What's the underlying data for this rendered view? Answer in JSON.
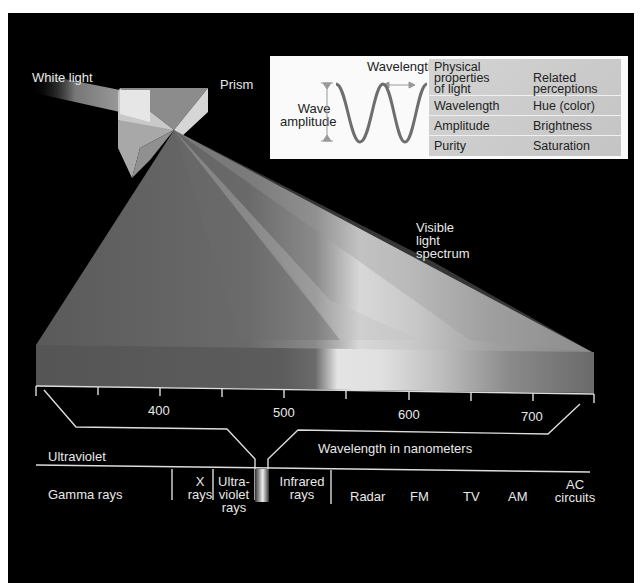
{
  "diagram": {
    "labels": {
      "white_light": "White light",
      "prism": "Prism",
      "visible_spectrum": [
        "Visible",
        "light",
        "spectrum"
      ],
      "ultraviolet": "Ultraviolet",
      "wavelength_axis": "Wavelength in nanometers"
    },
    "wave_inset": {
      "wavelength_label": "Wavelength",
      "amplitude_label": [
        "Wave",
        "amplitude"
      ]
    },
    "properties_table": {
      "headers": [
        [
          "Physical",
          "properties",
          "of light"
        ],
        [
          "Related",
          "perceptions"
        ]
      ],
      "rows": [
        {
          "property": "Wavelength",
          "perception": "Hue (color)"
        },
        {
          "property": "Amplitude",
          "perception": "Brightness"
        },
        {
          "property": "Purity",
          "perception": "Saturation"
        }
      ]
    },
    "nm_scale": {
      "ticks": [
        350,
        400,
        450,
        500,
        550,
        600,
        650,
        700,
        750
      ],
      "tick_labels": [
        "400",
        "500",
        "600",
        "700"
      ]
    },
    "em_spectrum": {
      "bands": [
        {
          "label": [
            "Gamma rays"
          ]
        },
        {
          "label": [
            "X",
            "rays"
          ]
        },
        {
          "label": [
            "Ultra-",
            "violet",
            "rays"
          ]
        },
        {
          "label": [
            "Infrared",
            "rays"
          ]
        },
        {
          "label": [
            "Radar"
          ]
        },
        {
          "label": [
            "FM"
          ]
        },
        {
          "label": [
            "TV"
          ]
        },
        {
          "label": [
            "AM"
          ]
        },
        {
          "label": [
            "AC",
            "circuits"
          ]
        }
      ]
    },
    "colors": {
      "background": "#000000",
      "label_text": "#e8e8e8",
      "inset_bg": "#fafafa",
      "table_bg": "#cccccc",
      "wave_stroke": "#6e6e6e"
    }
  }
}
